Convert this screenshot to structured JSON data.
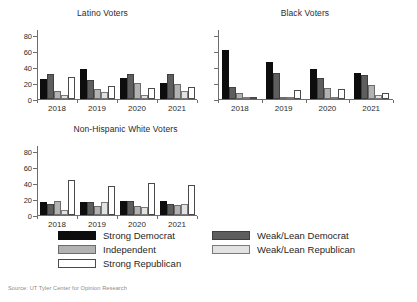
{
  "source_note": "Source: UT Tyler Center for Opinion Research",
  "legend": {
    "entries": [
      {
        "key": "sd",
        "label": "Strong Democrat"
      },
      {
        "key": "wld",
        "label": "Weak/Lean Democrat"
      },
      {
        "key": "ind",
        "label": "Independent"
      },
      {
        "key": "wlr",
        "label": "Weak/Lean Republican"
      },
      {
        "key": "sr",
        "label": "Strong Republican"
      }
    ],
    "colors": {
      "sd": "#0d0d0d",
      "wld": "#5e5e5e",
      "ind": "#b2b2b2",
      "wlr": "#e2e2e2",
      "sr": "#ffffff"
    }
  },
  "chart_data": [
    {
      "type": "bar",
      "title": "Latino Voters",
      "xlabel": "",
      "ylabel": "",
      "categories": [
        "2018",
        "2019",
        "2020",
        "2021"
      ],
      "ylim": [
        0,
        88
      ],
      "yticks": [
        0,
        20,
        40,
        60,
        80
      ],
      "ytick_labels": [
        "0",
        "20",
        "40",
        "60",
        "80"
      ],
      "grid": false,
      "legend_position": "below-figure",
      "series": [
        {
          "name": "Strong Democrat",
          "values": [
            25,
            38,
            27,
            20
          ]
        },
        {
          "name": "Weak/Lean Democrat",
          "values": [
            31,
            24,
            31,
            31
          ]
        },
        {
          "name": "Independent",
          "values": [
            10,
            12,
            20,
            19
          ]
        },
        {
          "name": "Weak/Lean Republican",
          "values": [
            5,
            9,
            5,
            10
          ]
        },
        {
          "name": "Strong Republican",
          "values": [
            28,
            16,
            14,
            15
          ]
        }
      ]
    },
    {
      "type": "bar",
      "title": "Black Voters",
      "xlabel": "",
      "ylabel": "",
      "categories": [
        "2018",
        "2019",
        "2020",
        "2021"
      ],
      "ylim": [
        0,
        88
      ],
      "yticks": [
        0,
        20,
        40,
        60,
        80
      ],
      "ytick_labels": [
        "",
        "",
        "",
        "",
        ""
      ],
      "grid": false,
      "legend_position": "below-figure",
      "series": [
        {
          "name": "Strong Democrat",
          "values": [
            62,
            46,
            38,
            33
          ]
        },
        {
          "name": "Weak/Lean Democrat",
          "values": [
            15,
            33,
            26,
            30
          ]
        },
        {
          "name": "Independent",
          "values": [
            7,
            3,
            14,
            17
          ]
        },
        {
          "name": "Weak/Lean Republican",
          "values": [
            1,
            1,
            2,
            5
          ]
        },
        {
          "name": "Strong Republican",
          "values": [
            3,
            11,
            13,
            8
          ]
        }
      ]
    },
    {
      "type": "bar",
      "title": "Non-Hispanic White Voters",
      "xlabel": "",
      "ylabel": "",
      "categories": [
        "2018",
        "2019",
        "2020",
        "2021"
      ],
      "ylim": [
        0,
        88
      ],
      "yticks": [
        0,
        20,
        40,
        60,
        80
      ],
      "ytick_labels": [
        "0",
        "20",
        "40",
        "60",
        "80"
      ],
      "grid": false,
      "legend_position": "below-figure",
      "series": [
        {
          "name": "Strong Democrat",
          "values": [
            16,
            16,
            18,
            17
          ]
        },
        {
          "name": "Weak/Lean Democrat",
          "values": [
            14,
            16,
            17,
            14
          ]
        },
        {
          "name": "Independent",
          "values": [
            18,
            11,
            11,
            13
          ]
        },
        {
          "name": "Weak/Lean Republican",
          "values": [
            6,
            16,
            10,
            14
          ]
        },
        {
          "name": "Strong Republican",
          "values": [
            44,
            37,
            40,
            38
          ]
        }
      ]
    }
  ]
}
